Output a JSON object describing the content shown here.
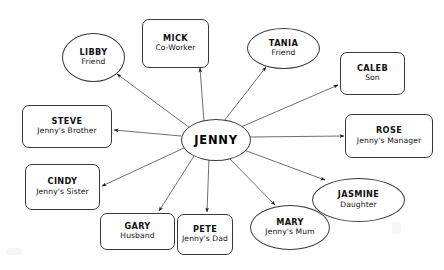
{
  "diagram": {
    "type": "radial-mind-map",
    "center": {
      "id": "jenny",
      "name": "JENNY",
      "role": "",
      "shape": "ellipse",
      "x": 181,
      "y": 119,
      "w": 68,
      "h": 40
    },
    "edge_style": {
      "color": "#4a4a4a",
      "width": 0.8,
      "arrow": "outward-from-center",
      "arrow_color": "#1a1a1a"
    },
    "nodes": [
      {
        "id": "libby",
        "name": "LIBBY",
        "role": "Friend",
        "shape": "ellipse",
        "x": 62,
        "y": 33,
        "w": 63,
        "h": 49,
        "anchor_x": 117,
        "anchor_y": 74
      },
      {
        "id": "mick",
        "name": "MICK",
        "role": "Co-Worker",
        "shape": "rect",
        "x": 142,
        "y": 19,
        "w": 67,
        "h": 49,
        "anchor_x": 200,
        "anchor_y": 68
      },
      {
        "id": "tania",
        "name": "TANIA",
        "role": "Friend",
        "shape": "ellipse",
        "x": 247,
        "y": 28,
        "w": 73,
        "h": 41,
        "anchor_x": 265,
        "anchor_y": 66
      },
      {
        "id": "caleb",
        "name": "CALEB",
        "role": "Son",
        "shape": "rect",
        "x": 340,
        "y": 52,
        "w": 65,
        "h": 43,
        "anchor_x": 339,
        "anchor_y": 84
      },
      {
        "id": "rose",
        "name": "ROSE",
        "role": "Jenny's Manager",
        "shape": "rect",
        "x": 345,
        "y": 114,
        "w": 88,
        "h": 44,
        "anchor_x": 344,
        "anchor_y": 136
      },
      {
        "id": "jasmine",
        "name": "JASMINE",
        "role": "Daughter",
        "shape": "ellipse",
        "x": 312,
        "y": 178,
        "w": 93,
        "h": 44,
        "anchor_x": 326,
        "anchor_y": 180
      },
      {
        "id": "mary",
        "name": "MARY",
        "role": "Jenny's Mum",
        "shape": "ellipse",
        "x": 250,
        "y": 205,
        "w": 80,
        "h": 45,
        "anchor_x": 274,
        "anchor_y": 205
      },
      {
        "id": "pete",
        "name": "PETE",
        "role": "Jenny's Dad",
        "shape": "rect",
        "x": 177,
        "y": 214,
        "w": 56,
        "h": 41,
        "anchor_x": 208,
        "anchor_y": 213
      },
      {
        "id": "gary",
        "name": "GARY",
        "role": "Husband",
        "shape": "rect",
        "x": 100,
        "y": 213,
        "w": 75,
        "h": 37,
        "anchor_x": 158,
        "anchor_y": 212
      },
      {
        "id": "cindy",
        "name": "CINDY",
        "role": "Jenny's Sister",
        "shape": "rect",
        "x": 25,
        "y": 164,
        "w": 75,
        "h": 46,
        "anchor_x": 101,
        "anchor_y": 186
      },
      {
        "id": "steve",
        "name": "STEVE",
        "role": "Jenny's Brother",
        "shape": "rect",
        "x": 22,
        "y": 105,
        "w": 90,
        "h": 43,
        "anchor_x": 113,
        "anchor_y": 130
      }
    ],
    "edges": [
      {
        "from": "jenny",
        "to": "libby",
        "start_x": 190,
        "start_y": 128,
        "end_x": 117,
        "end_y": 74
      },
      {
        "from": "jenny",
        "to": "mick",
        "start_x": 204,
        "start_y": 122,
        "end_x": 200,
        "end_y": 68
      },
      {
        "from": "jenny",
        "to": "tania",
        "start_x": 224,
        "start_y": 121,
        "end_x": 266,
        "end_y": 67
      },
      {
        "from": "jenny",
        "to": "caleb",
        "start_x": 241,
        "start_y": 127,
        "end_x": 338,
        "end_y": 85
      },
      {
        "from": "jenny",
        "to": "rose",
        "start_x": 249,
        "start_y": 137,
        "end_x": 344,
        "end_y": 136
      },
      {
        "from": "jenny",
        "to": "jasmine",
        "start_x": 244,
        "start_y": 150,
        "end_x": 325,
        "end_y": 180
      },
      {
        "from": "jenny",
        "to": "mary",
        "start_x": 228,
        "start_y": 157,
        "end_x": 275,
        "end_y": 205
      },
      {
        "from": "jenny",
        "to": "pete",
        "start_x": 209,
        "start_y": 159,
        "end_x": 207,
        "end_y": 212
      },
      {
        "from": "jenny",
        "to": "gary",
        "start_x": 194,
        "start_y": 156,
        "end_x": 159,
        "end_y": 211
      },
      {
        "from": "jenny",
        "to": "cindy",
        "start_x": 184,
        "start_y": 148,
        "end_x": 102,
        "end_y": 186
      },
      {
        "from": "jenny",
        "to": "steve",
        "start_x": 181,
        "start_y": 136,
        "end_x": 114,
        "end_y": 130
      }
    ]
  }
}
